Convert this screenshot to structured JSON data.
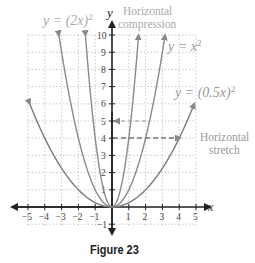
{
  "chart_data": {
    "type": "line",
    "title": "",
    "caption": "Figure 23",
    "xlabel": "x",
    "ylabel": "y",
    "xlim": [
      -5,
      5
    ],
    "ylim": [
      -1,
      10
    ],
    "grid": true,
    "x_ticks": [
      "-5",
      "-4",
      "-3",
      "-2",
      "-1",
      "1",
      "2",
      "3",
      "4",
      "5"
    ],
    "y_ticks": [
      "-1",
      "1",
      "2",
      "3",
      "4",
      "5",
      "6",
      "7",
      "8",
      "9",
      "10"
    ],
    "series": [
      {
        "name": "y = (2x)^2",
        "label": "y = (2x)²",
        "formula": "(2x)^2",
        "color": "#888888",
        "x": [
          -1.58,
          -1,
          -0.5,
          0,
          0.5,
          1,
          1.58
        ],
        "values": [
          10,
          4,
          1,
          0,
          1,
          4,
          10
        ]
      },
      {
        "name": "y = x^2",
        "label": "y = x²",
        "formula": "x^2",
        "color": "#888888",
        "x": [
          -3.16,
          -2,
          -1,
          0,
          1,
          2,
          3.16
        ],
        "values": [
          10,
          4,
          1,
          0,
          1,
          4,
          10
        ]
      },
      {
        "name": "y = (0.5x)^2",
        "label": "y = (0.5x)²",
        "formula": "(0.5x)^2",
        "color": "#777777",
        "x": [
          -4.9,
          -4,
          -2,
          0,
          2,
          4,
          4.9
        ],
        "values": [
          6,
          4,
          1,
          0,
          1,
          4,
          6
        ]
      }
    ],
    "annotations": [
      {
        "text": "Horizontal compression",
        "line1": "Horizontal",
        "line2": "compression",
        "arrow_from": [
          2.24,
          5
        ],
        "arrow_to": [
          0,
          5
        ],
        "style": "dashed"
      },
      {
        "text": "Horizontal stretch",
        "line1": "Horizontal",
        "line2": "stretch",
        "arrow_from": [
          0,
          4
        ],
        "arrow_to": [
          4,
          4
        ],
        "style": "dashed"
      }
    ]
  },
  "labels": {
    "axis_x": "x",
    "axis_y": "y",
    "eq_2x_prefix": "y = (2x)",
    "eq_2x_exp": "2",
    "eq_x_prefix": "y = x",
    "eq_x_exp": "2",
    "eq_05x_prefix": "y = (0.5x)",
    "eq_05x_exp": "2",
    "compression_line1": "Horizontal",
    "compression_line2": "compression",
    "stretch_line1": "Horizontal",
    "stretch_line2": "stretch",
    "caption": "Figure 23"
  }
}
